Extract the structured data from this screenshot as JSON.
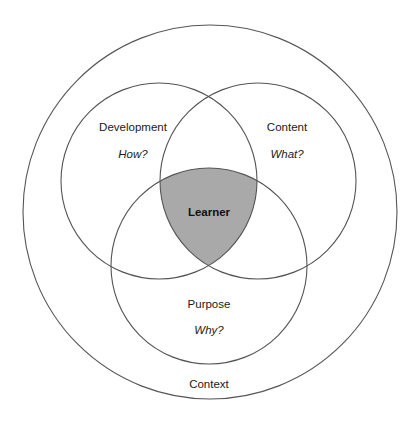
{
  "diagram": {
    "type": "venn",
    "outer": {
      "label": "Context"
    },
    "sets": [
      {
        "id": "development",
        "label": "Development",
        "question": "How?"
      },
      {
        "id": "content",
        "label": "Content",
        "question": "What?"
      },
      {
        "id": "purpose",
        "label": "Purpose",
        "question": "Why?"
      }
    ],
    "intersection": {
      "label": "Learner",
      "sets": [
        "development",
        "content",
        "purpose"
      ]
    },
    "colors": {
      "stroke": "#555555",
      "intersection_fill": "#a9a9a9",
      "background": "#ffffff",
      "text": "#1a1a1a"
    }
  }
}
